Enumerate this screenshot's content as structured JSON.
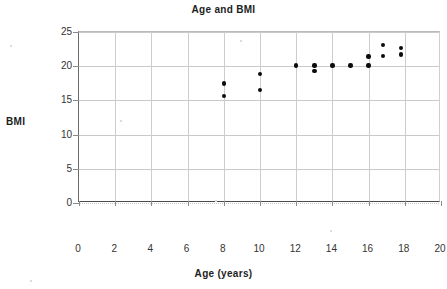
{
  "chart_data": {
    "type": "scatter",
    "title": "Age and BMI",
    "xlabel": "Age (years)",
    "ylabel": "BMI",
    "xlim": [
      0,
      20
    ],
    "ylim": [
      0,
      25
    ],
    "xticks": [
      0,
      2,
      4,
      6,
      8,
      10,
      12,
      14,
      16,
      18,
      20
    ],
    "yticks": [
      0,
      5,
      10,
      15,
      20,
      25
    ],
    "xtick_labels": [
      "0",
      "2",
      "4",
      "6",
      "8",
      "10",
      "12",
      "14",
      "16",
      "18",
      "20"
    ],
    "ytick_labels": [
      "0",
      "5",
      "10",
      "15",
      "20",
      "25"
    ],
    "grid": true,
    "legend": null,
    "marker": {
      "shape": "circle",
      "color": "#0c0c0c",
      "size_px": 4.4
    },
    "series": [
      {
        "name": "BMI by age",
        "points": [
          {
            "x": 8.0,
            "y": 17.5
          },
          {
            "x": 8.0,
            "y": 15.6
          },
          {
            "x": 10.0,
            "y": 18.9
          },
          {
            "x": 10.0,
            "y": 16.5
          },
          {
            "x": 12.0,
            "y": 20.1
          },
          {
            "x": 13.0,
            "y": 20.1
          },
          {
            "x": 13.0,
            "y": 19.3
          },
          {
            "x": 14.0,
            "y": 20.1
          },
          {
            "x": 15.0,
            "y": 20.1
          },
          {
            "x": 16.0,
            "y": 21.4
          },
          {
            "x": 16.0,
            "y": 20.1
          },
          {
            "x": 16.8,
            "y": 23.1
          },
          {
            "x": 16.8,
            "y": 21.5
          },
          {
            "x": 17.8,
            "y": 22.7
          },
          {
            "x": 17.8,
            "y": 21.7
          }
        ]
      }
    ]
  }
}
